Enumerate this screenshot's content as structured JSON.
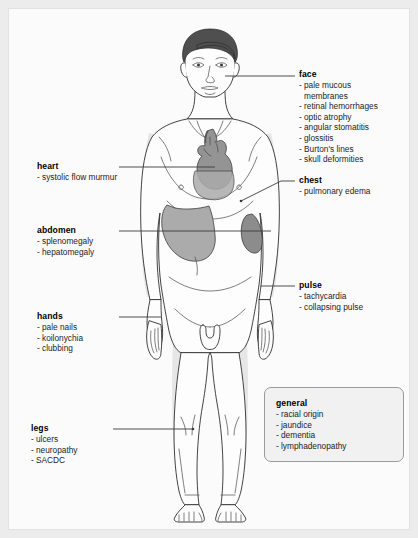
{
  "figure": {
    "background_color": "#ececed",
    "panel_color": "#fbfbfb",
    "line_color": "#3a3a3a",
    "skin_color": "#fdfdfd",
    "shadow_color": "#e4e4e4",
    "hair_color": "#4c4c4c",
    "heart_color": "#8f8f8f",
    "liver_color": "#a8a8a8",
    "spleen_color": "#8a8a8a"
  },
  "labels": {
    "face": {
      "title": "face",
      "items": [
        "pale mucous",
        "membranes",
        "retinal hemorrhages",
        "optic atrophy",
        "angular stomatitis",
        "glossitis",
        "Burton's lines",
        "skull deformities"
      ],
      "continuation_indices": [
        1
      ]
    },
    "chest": {
      "title": "chest",
      "items": [
        "pulmonary edema"
      ],
      "continuation_indices": []
    },
    "pulse": {
      "title": "pulse",
      "items": [
        "tachycardia",
        "collapsing pulse"
      ],
      "continuation_indices": []
    },
    "general": {
      "title": "general",
      "items": [
        "racial origin",
        "jaundice",
        "dementia",
        "lymphadenopathy"
      ],
      "continuation_indices": []
    },
    "heart": {
      "title": "heart",
      "items": [
        "systolic flow murmur"
      ],
      "continuation_indices": []
    },
    "abdomen": {
      "title": "abdomen",
      "items": [
        "splenomegaly",
        "hepatomegaly"
      ],
      "continuation_indices": []
    },
    "hands": {
      "title": "hands",
      "items": [
        "pale nails",
        "koilonychia",
        "clubbing"
      ],
      "continuation_indices": []
    },
    "legs": {
      "title": "legs",
      "items": [
        "ulcers",
        "neuropathy",
        "SACDC"
      ],
      "continuation_indices": []
    }
  }
}
